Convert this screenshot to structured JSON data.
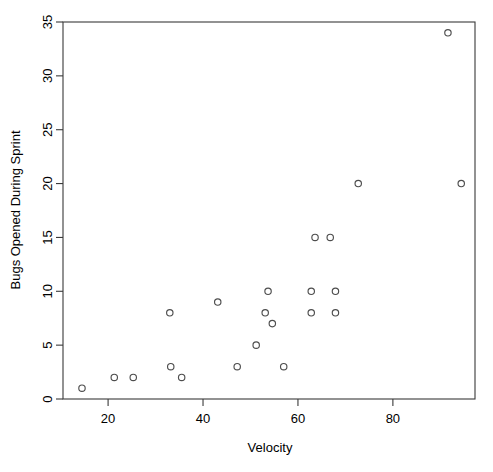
{
  "chart_data": {
    "type": "scatter",
    "title": "",
    "xlabel": "Velocity",
    "ylabel": "Bugs Opened During Sprint",
    "xlim": [
      10.5,
      97.3
    ],
    "ylim": [
      0,
      35
    ],
    "grid": false,
    "legend": null,
    "xticks": [
      20,
      40,
      60,
      80
    ],
    "yticks": [
      0,
      5,
      10,
      15,
      20,
      25,
      30,
      35
    ],
    "xtick_labels": [
      "20",
      "40",
      "60",
      "80"
    ],
    "ytick_labels": [
      "0",
      "5",
      "10",
      "15",
      "20",
      "25",
      "30",
      "35"
    ],
    "marker": "open-circle",
    "marker_color": "#4d4d4d",
    "points": [
      {
        "x": 14.5,
        "y": 1
      },
      {
        "x": 21.3,
        "y": 2
      },
      {
        "x": 25.3,
        "y": 2
      },
      {
        "x": 33.0,
        "y": 8
      },
      {
        "x": 33.2,
        "y": 3
      },
      {
        "x": 35.5,
        "y": 2
      },
      {
        "x": 43.1,
        "y": 9
      },
      {
        "x": 47.2,
        "y": 3
      },
      {
        "x": 51.2,
        "y": 5
      },
      {
        "x": 53.1,
        "y": 8
      },
      {
        "x": 53.7,
        "y": 10
      },
      {
        "x": 54.6,
        "y": 7
      },
      {
        "x": 57.0,
        "y": 3
      },
      {
        "x": 62.8,
        "y": 8
      },
      {
        "x": 62.8,
        "y": 10
      },
      {
        "x": 63.6,
        "y": 15
      },
      {
        "x": 66.8,
        "y": 15
      },
      {
        "x": 67.9,
        "y": 8
      },
      {
        "x": 67.9,
        "y": 10
      },
      {
        "x": 72.7,
        "y": 20
      },
      {
        "x": 91.6,
        "y": 34
      },
      {
        "x": 94.4,
        "y": 20
      }
    ]
  }
}
